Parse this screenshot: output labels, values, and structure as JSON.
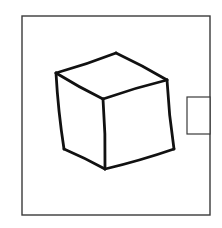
{
  "figure": {
    "colors": {
      "background": "#ffffff",
      "frame_stroke": "#3a3a3a",
      "cube_stroke": "#111111"
    },
    "frame": {
      "x": 22,
      "y": 16,
      "width": 188,
      "height": 199
    },
    "side_tab": {
      "x": 187,
      "y": 97,
      "width": 23,
      "height": 37
    },
    "cube": {
      "vertices": {
        "top": [
          116,
          53
        ],
        "left_top": [
          56,
          73
        ],
        "right_top": [
          167,
          80
        ],
        "front_top": [
          103,
          99
        ],
        "left_bottom": [
          64,
          149
        ],
        "right_bottom": [
          174,
          149
        ],
        "front_bottom": [
          105,
          169
        ]
      },
      "edges": [
        [
          "left_top",
          "top"
        ],
        [
          "top",
          "right_top"
        ],
        [
          "left_top",
          "front_top"
        ],
        [
          "front_top",
          "right_top"
        ],
        [
          "left_top",
          "left_bottom"
        ],
        [
          "front_top",
          "front_bottom"
        ],
        [
          "right_top",
          "right_bottom"
        ],
        [
          "left_bottom",
          "front_bottom"
        ],
        [
          "front_bottom",
          "right_bottom"
        ]
      ]
    }
  }
}
